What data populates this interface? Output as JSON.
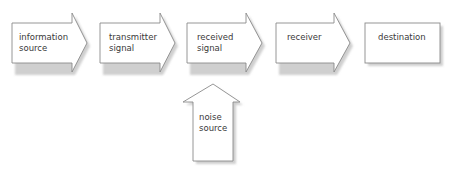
{
  "diagram": {
    "title": "",
    "nodes": [
      {
        "id": "information-source",
        "lines": [
          "information",
          "source"
        ],
        "shape": "right-arrow"
      },
      {
        "id": "transmitter-signal",
        "lines": [
          "transmitter",
          "signal"
        ],
        "shape": "right-arrow"
      },
      {
        "id": "received-signal",
        "lines": [
          "received",
          "signal"
        ],
        "shape": "right-arrow"
      },
      {
        "id": "receiver",
        "lines": [
          "receiver"
        ],
        "shape": "right-arrow"
      },
      {
        "id": "destination",
        "lines": [
          "destination"
        ],
        "shape": "box"
      },
      {
        "id": "noise-source",
        "lines": [
          "noise",
          "source"
        ],
        "shape": "up-arrow"
      }
    ],
    "edges": [
      {
        "from": "information-source",
        "to": "transmitter-signal"
      },
      {
        "from": "transmitter-signal",
        "to": "received-signal"
      },
      {
        "from": "received-signal",
        "to": "receiver"
      },
      {
        "from": "receiver",
        "to": "destination"
      },
      {
        "from": "noise-source",
        "to": "received-signal"
      }
    ],
    "colors": {
      "stroke": "#8a8a8a",
      "fill": "#ffffff",
      "shadow": "#d4d4d4",
      "text": "#3a3a3a"
    }
  }
}
